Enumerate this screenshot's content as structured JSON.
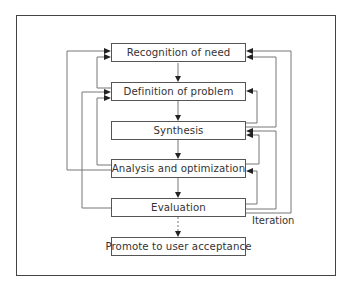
{
  "diagram": {
    "title": "",
    "nodes": [
      {
        "id": "n1",
        "label": "Recognition of need",
        "top": 43
      },
      {
        "id": "n2",
        "label": "Definition of problem",
        "top": 82
      },
      {
        "id": "n3",
        "label": "Synthesis",
        "top": 121
      },
      {
        "id": "n4",
        "label": "Analysis and optimization",
        "top": 159
      },
      {
        "id": "n5",
        "label": "Evaluation",
        "top": 198
      },
      {
        "id": "n6",
        "label": "Promote to user acceptance",
        "top": 237
      }
    ],
    "iteration_label": "Iteration",
    "edges": [
      {
        "from": "n1",
        "to": "n2",
        "type": "forward"
      },
      {
        "from": "n2",
        "to": "n3",
        "type": "forward"
      },
      {
        "from": "n3",
        "to": "n4",
        "type": "forward"
      },
      {
        "from": "n4",
        "to": "n5",
        "type": "forward"
      },
      {
        "from": "n5",
        "to": "n6",
        "type": "forward"
      },
      {
        "from": "n4",
        "to": "n1",
        "type": "feedback",
        "side": "left"
      },
      {
        "from": "n2",
        "to": "n1",
        "type": "feedback",
        "side": "left"
      },
      {
        "from": "n5",
        "to": "n2",
        "type": "feedback",
        "side": "left"
      },
      {
        "from": "n4",
        "to": "n2",
        "type": "feedback",
        "side": "left"
      },
      {
        "from": "n5",
        "to": "n1",
        "type": "feedback",
        "side": "right"
      },
      {
        "from": "n3",
        "to": "n1",
        "type": "feedback",
        "side": "right"
      },
      {
        "from": "n3",
        "to": "n2",
        "type": "feedback",
        "side": "right"
      },
      {
        "from": "n5",
        "to": "n3",
        "type": "feedback",
        "side": "right"
      },
      {
        "from": "n4",
        "to": "n3",
        "type": "feedback",
        "side": "right"
      },
      {
        "from": "n5",
        "to": "n4",
        "type": "feedback",
        "side": "right"
      }
    ],
    "colors": {
      "line": "#777777",
      "arrow": "#222222",
      "border": "#555555",
      "text": "#333333"
    }
  }
}
